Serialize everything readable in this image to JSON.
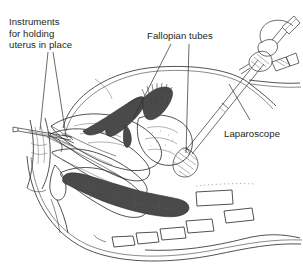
{
  "figure": {
    "background_color": "#ffffff",
    "ink_color": "#231f20",
    "labels": {
      "instruments": {
        "line1": "Instruments",
        "line2": "for holding",
        "line3": "uterus in place"
      },
      "fallopian": "Fallopian tubes",
      "laparoscope": "Laparoscope"
    },
    "anatomy": [
      "abdominal-wall",
      "uterus",
      "fallopian-tube-left",
      "fallopian-tube-right",
      "ovary",
      "bladder",
      "vagina",
      "rectum",
      "sigmoid-colon",
      "sacrum",
      "vertebrae"
    ],
    "instruments": [
      "laparoscope-eyepiece",
      "laparoscope-light-port",
      "laparoscope-shaft",
      "grasping-forceps-tip",
      "uterine-manipulator",
      "cervical-tenaculum"
    ],
    "vertebrae_count": 6
  }
}
